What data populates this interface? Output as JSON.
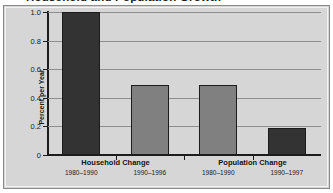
{
  "chart_data": {
    "type": "bar",
    "title": "Household and Population Growth",
    "xlabel": "",
    "ylabel": "Percent per Year",
    "ylim": [
      0,
      1.0
    ],
    "grid": true,
    "legend": "none",
    "categories": [
      "1980–1990",
      "1990–1996",
      "1980–1990",
      "1990–1997"
    ],
    "values": [
      1.0,
      0.49,
      0.49,
      0.19
    ],
    "bar_colors": [
      "#333333",
      "#808080",
      "#808080",
      "#333333"
    ],
    "ytick_labels": [
      "0",
      "0.2",
      "0.4",
      "0.6",
      "0.8",
      "1.0"
    ],
    "ytick_values": [
      0,
      0.2,
      0.4,
      0.6,
      0.8,
      1.0
    ],
    "groups": [
      {
        "label": "Household Change",
        "categories": [
          "1980–1990",
          "1990–1996"
        ]
      },
      {
        "label": "Population Change",
        "categories": [
          "1980–1990",
          "1990–1997"
        ]
      }
    ]
  },
  "figure": {
    "title": "Household and Population Growth",
    "ylabel": "Percent per Year",
    "group_labels": [
      "Household Change",
      "Population Change"
    ],
    "period_labels": [
      "1980–1990",
      "1990–1996",
      "1980–1990",
      "1990–1997"
    ],
    "ytick_labels": [
      "0",
      "0.2",
      "0.4",
      "0.6",
      "0.8",
      "1.0"
    ]
  },
  "colors": {
    "bar_dark": "#333333",
    "bar_light": "#808080",
    "plot_background": "#d6d6d6",
    "axis": "#1c1c1c",
    "gridline": "#8e8e8e"
  }
}
